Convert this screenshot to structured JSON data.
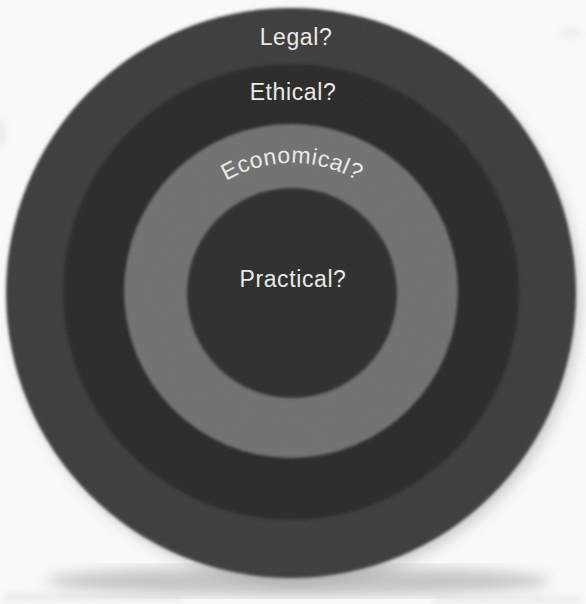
{
  "figure": {
    "type": "concentric-rings-diagram",
    "background_color": "#fbfbf9",
    "text_color": "#ebebe8",
    "rings": [
      {
        "label": "Legal?",
        "color": "#3d3d3d"
      },
      {
        "label": "Ethical?",
        "color": "#2b2b2b"
      },
      {
        "label": "Economical?",
        "color": "#717171"
      },
      {
        "label": "Practical?",
        "color": "#2f2f2f"
      }
    ]
  }
}
